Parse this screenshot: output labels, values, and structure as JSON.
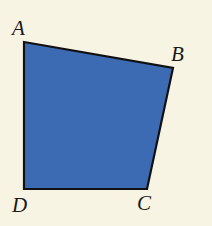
{
  "figure": {
    "type": "quadrilateral",
    "fill_color": "#3d6bb3",
    "stroke_color": "#111111",
    "background_color": "#f7f4e4",
    "vertices": [
      {
        "label": "A",
        "x": 24,
        "y": 42,
        "label_x": 12,
        "label_y": 35
      },
      {
        "label": "B",
        "x": 173,
        "y": 68,
        "label_x": 171,
        "label_y": 61
      },
      {
        "label": "C",
        "x": 147,
        "y": 189,
        "label_x": 137,
        "label_y": 210
      },
      {
        "label": "D",
        "x": 24,
        "y": 189,
        "label_x": 12,
        "label_y": 212
      }
    ]
  }
}
